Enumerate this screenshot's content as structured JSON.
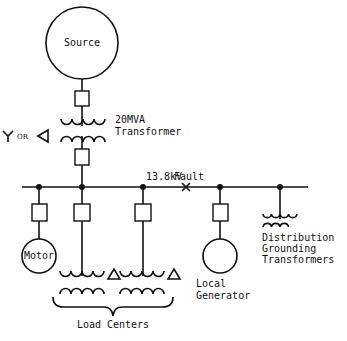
{
  "diagram": {
    "source": {
      "label": "Source"
    },
    "main_transformer": {
      "label_line1": "20MVA",
      "label_line2": "Transformer",
      "winding_note": {
        "wye_symbol": "Y",
        "or_text": "OR",
        "delta_symbol": "◁"
      }
    },
    "bus": {
      "voltage_label": "13.8kV",
      "fault_label": "Fault",
      "fault_marker": "×"
    },
    "motor": {
      "label": "Motor"
    },
    "load_centers": {
      "label": "Load Centers",
      "count": 2,
      "delta_symbol": "△"
    },
    "local_generator": {
      "label_line1": "Local",
      "label_line2": "Generator"
    },
    "grounding_transformers": {
      "label_line1": "Distribution",
      "label_line2": "Grounding",
      "label_line3": "Transformers"
    }
  }
}
